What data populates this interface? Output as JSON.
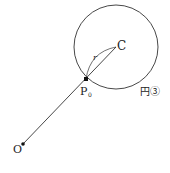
{
  "diagram": {
    "colors": {
      "stroke": "#333333",
      "text": "#222222",
      "background": "#ffffff"
    },
    "labels": {
      "center": "C",
      "radius": "r",
      "point_p": "P",
      "point_p_sub": "0",
      "origin": "O",
      "circle": "円③"
    },
    "geometry": {
      "circle": {
        "cx": 116,
        "cy": 47,
        "r": 42
      },
      "origin": {
        "x": 23,
        "y": 144
      },
      "p0": {
        "x": 86,
        "y": 79
      },
      "center": {
        "x": 116,
        "y": 47
      }
    }
  }
}
